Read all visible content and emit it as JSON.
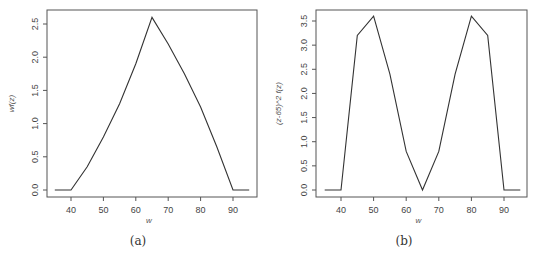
{
  "chart_data": [
    {
      "type": "line",
      "caption": "(a)",
      "title": "",
      "xlabel": "w",
      "ylabel": "wf(z)",
      "x": [
        35,
        40,
        45,
        50,
        55,
        60,
        65,
        70,
        75,
        80,
        85,
        90,
        95
      ],
      "values": [
        0,
        0,
        0.35,
        0.8,
        1.3,
        1.9,
        2.6,
        2.2,
        1.75,
        1.25,
        0.65,
        0,
        0
      ],
      "xticks": [
        40,
        50,
        60,
        70,
        80,
        90
      ],
      "xtick_labels": [
        "40",
        "50",
        "60",
        "70",
        "80",
        "90"
      ],
      "yticks": [
        0.0,
        0.5,
        1.0,
        1.5,
        2.0,
        2.5
      ],
      "ytick_labels": [
        "0.0",
        "0.5",
        "1.0",
        "1.5",
        "2.0",
        "2.5"
      ],
      "xlim": [
        33,
        97
      ],
      "ylim": [
        -0.1,
        2.7
      ],
      "grid": false,
      "legend": null
    },
    {
      "type": "line",
      "caption": "(b)",
      "title": "",
      "xlabel": "w",
      "ylabel": "(z-65)^2 f(z)",
      "x": [
        35,
        40,
        45,
        50,
        55,
        60,
        65,
        70,
        75,
        80,
        85,
        90,
        95
      ],
      "values": [
        0,
        0,
        3.2,
        3.6,
        2.4,
        0.8,
        0,
        0.8,
        2.4,
        3.6,
        3.2,
        0,
        0
      ],
      "xticks": [
        40,
        50,
        60,
        70,
        80,
        90
      ],
      "xtick_labels": [
        "40",
        "50",
        "60",
        "70",
        "80",
        "90"
      ],
      "yticks": [
        0.0,
        0.5,
        1.0,
        1.5,
        2.0,
        2.5,
        3.0,
        3.5
      ],
      "ytick_labels": [
        "0.0",
        "0.5",
        "1.0",
        "1.5",
        "2.0",
        "2.5",
        "3.0",
        "3.5"
      ],
      "xlim": [
        33,
        97
      ],
      "ylim": [
        -0.14,
        3.75
      ],
      "grid": false,
      "legend": null
    }
  ],
  "panels": {
    "a": {
      "caption": "(a)",
      "xlabel": "w",
      "ylabel": "wf(z)"
    },
    "b": {
      "caption": "(b)",
      "xlabel": "w",
      "ylabel": "(z-65)^2 f(z)"
    }
  },
  "colors": {
    "line": "#333333",
    "axis": "#555555",
    "text": "#444444"
  }
}
